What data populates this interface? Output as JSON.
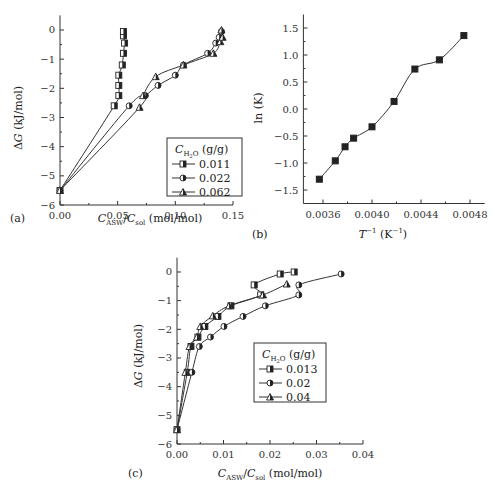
{
  "figure": {
    "panels": [
      "(a)",
      "(b)",
      "(c)"
    ]
  },
  "chart_data": [
    {
      "id": "a",
      "panel_label": "(a)",
      "type": "line",
      "xlabel": "C_ASW/C_sol (mol/mol)",
      "ylabel": "ΔG (kJ/mol)",
      "xlim": [
        0.0,
        0.15
      ],
      "ylim": [
        -6,
        0.5
      ],
      "xticks": [
        "0.00",
        "0.05",
        "0.10",
        "0.15"
      ],
      "yticks": [
        "0",
        "-1",
        "-2",
        "-3",
        "-4",
        "-5",
        "-6"
      ],
      "legend_title": "C_H2O (g/g)",
      "legend_position": "lower right",
      "series": [
        {
          "name": "0.011",
          "marker": "half-square",
          "x": [
            0.0,
            0.047,
            0.051,
            0.051,
            0.051,
            0.054,
            0.055,
            0.056,
            0.055,
            0.055
          ],
          "y": [
            -5.5,
            -2.6,
            -2.25,
            -1.9,
            -1.55,
            -1.2,
            -0.8,
            -0.45,
            -0.2,
            -0.05
          ]
        },
        {
          "name": "0.022",
          "marker": "half-circle",
          "x": [
            0.0,
            0.06,
            0.074,
            0.085,
            0.1,
            0.107,
            0.128,
            0.135,
            0.138,
            0.14
          ],
          "y": [
            -5.5,
            -2.6,
            -2.25,
            -1.9,
            -1.55,
            -1.2,
            -0.8,
            -0.45,
            -0.25,
            -0.05
          ]
        },
        {
          "name": "0.062",
          "marker": "triangle",
          "x": [
            0.0,
            0.069,
            0.072,
            0.083,
            0.107,
            0.133,
            0.139,
            0.141,
            0.14
          ],
          "y": [
            -5.5,
            -2.65,
            -2.25,
            -1.6,
            -1.2,
            -0.8,
            -0.4,
            -0.25,
            0.0
          ]
        }
      ]
    },
    {
      "id": "b",
      "panel_label": "(b)",
      "type": "line",
      "xlabel": "T^-1 (K^-1)",
      "ylabel": "ln (K)",
      "xlim": [
        0.00344,
        0.00492
      ],
      "ylim": [
        -1.75,
        1.75
      ],
      "xticks": [
        "0.0036",
        "0.0040",
        "0.0044",
        "0.0048"
      ],
      "yticks": [
        "1.5",
        "1.0",
        "0.5",
        "0.0",
        "-0.5",
        "-1.0",
        "-1.5"
      ],
      "series": [
        {
          "name": "ln(K)",
          "marker": "square",
          "x": [
            0.00357,
            0.0037,
            0.00378,
            0.00385,
            0.004,
            0.00418,
            0.00435,
            0.00455,
            0.00475
          ],
          "y": [
            -1.3,
            -0.96,
            -0.7,
            -0.54,
            -0.33,
            0.14,
            0.74,
            0.91,
            1.36
          ]
        }
      ]
    },
    {
      "id": "c",
      "panel_label": "(c)",
      "type": "line",
      "xlabel": "C_ASW/C_sol (mol/mol)",
      "ylabel": "ΔG (kJ/mol)",
      "xlim": [
        0.0,
        0.04
      ],
      "ylim": [
        -6,
        0.5
      ],
      "xticks": [
        "0.00",
        "0.01",
        "0.02",
        "0.03",
        "0.04"
      ],
      "yticks": [
        "0",
        "-1",
        "-2",
        "-3",
        "-4",
        "-5",
        "-6"
      ],
      "legend_title": "C_H2O (g/g)",
      "legend_position": "center right",
      "series": [
        {
          "name": "0.013",
          "marker": "half-square",
          "x": [
            0.0,
            0.0022,
            0.003,
            0.0045,
            0.006,
            0.0088,
            0.0116,
            0.018,
            0.0166,
            0.0222,
            0.0252
          ],
          "y": [
            -5.5,
            -3.5,
            -2.6,
            -2.27,
            -1.9,
            -1.55,
            -1.18,
            -0.8,
            -0.45,
            -0.07,
            0.0
          ]
        },
        {
          "name": "0.02",
          "marker": "half-circle",
          "x": [
            0.0,
            0.0032,
            0.0048,
            0.0072,
            0.0101,
            0.0142,
            0.019,
            0.0262,
            0.0262,
            0.0353
          ],
          "y": [
            -5.5,
            -3.5,
            -2.6,
            -2.27,
            -1.9,
            -1.55,
            -1.18,
            -0.8,
            -0.45,
            -0.07
          ]
        },
        {
          "name": "0.04",
          "marker": "triangle",
          "x": [
            0.0,
            0.0018,
            0.0027,
            0.0043,
            0.005,
            0.0077,
            0.0112,
            0.0185,
            0.0236
          ],
          "y": [
            -5.5,
            -3.5,
            -2.6,
            -2.27,
            -1.9,
            -1.53,
            -1.18,
            -0.8,
            -0.42
          ]
        }
      ]
    }
  ]
}
